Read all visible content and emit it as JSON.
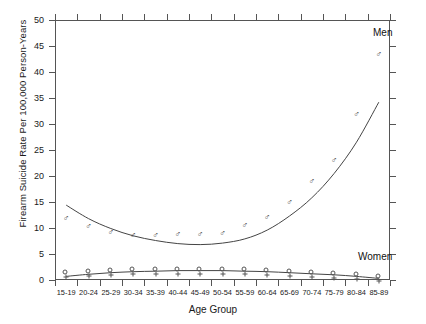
{
  "chart_data": {
    "type": "scatter",
    "title": "",
    "xlabel": "Age Group",
    "ylabel": "Firearm Suicide Rate Per 100,000 Person-Years",
    "ylim": [
      0,
      50
    ],
    "ytick_values": [
      0,
      5,
      10,
      15,
      20,
      25,
      30,
      35,
      40,
      45,
      50
    ],
    "ytick_labels": [
      "0",
      "5",
      "10",
      "15",
      "20",
      "25",
      "30",
      "35",
      "40",
      "45",
      "50"
    ],
    "grid": false,
    "legend_position": "inline-annotation",
    "categories": [
      "15-19",
      "20-24",
      "25-29",
      "30-34",
      "35-39",
      "40-44",
      "45-49",
      "50-54",
      "55-59",
      "60-64",
      "65-69",
      "70-74",
      "75-79",
      "80-84",
      "85-89"
    ],
    "series": [
      {
        "name": "Men",
        "marker": "mars-symbol",
        "label": "Men",
        "color": "#4a4a4a",
        "values": [
          12.0,
          10.3,
          9.2,
          8.7,
          8.6,
          8.8,
          8.8,
          9.0,
          10.5,
          12.2,
          15.0,
          19.0,
          23.0,
          32.0,
          43.5
        ],
        "fit": {
          "type": "quadratic-smooth",
          "values": [
            14.4,
            11.8,
            9.9,
            8.5,
            7.6,
            7.0,
            6.8,
            7.1,
            7.9,
            9.6,
            12.3,
            15.8,
            20.5,
            26.5,
            34.2
          ]
        }
      },
      {
        "name": "Women",
        "marker": "venus-symbol",
        "label": "Women",
        "color": "#4a4a4a",
        "values": [
          1.2,
          1.3,
          1.5,
          1.7,
          1.8,
          1.8,
          1.8,
          1.8,
          1.7,
          1.5,
          1.3,
          1.1,
          0.9,
          0.7,
          0.4
        ],
        "fit": {
          "type": "smooth",
          "values": [
            0.7,
            1.1,
            1.4,
            1.6,
            1.7,
            1.8,
            1.8,
            1.8,
            1.7,
            1.6,
            1.4,
            1.2,
            1.0,
            0.7,
            0.3
          ]
        }
      }
    ]
  },
  "annotations": {
    "men_label": "Men",
    "women_label": "Women"
  }
}
